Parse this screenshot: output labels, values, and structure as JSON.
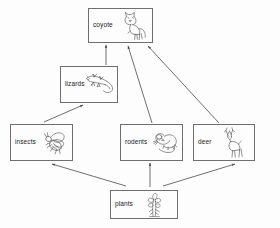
{
  "diagram": {
    "background_color": "#fdfdfd",
    "line_color": "#6e6e6e",
    "arrow_color": "#4a4a4a",
    "text_color": "#1a1a1a",
    "nodes": [
      {
        "id": "coyote",
        "label": "coyote",
        "icon": "coyote-illustration",
        "x": 88,
        "y": 8,
        "w": 65,
        "h": 35
      },
      {
        "id": "lizards",
        "label": "lizards",
        "icon": "lizard-illustration",
        "x": 60,
        "y": 66,
        "w": 58,
        "h": 37
      },
      {
        "id": "insects",
        "label": "insects",
        "icon": "insect-illustration",
        "x": 10,
        "y": 124,
        "w": 63,
        "h": 37
      },
      {
        "id": "rodents",
        "label": "rodents",
        "icon": "rodent-illustration",
        "x": 120,
        "y": 124,
        "w": 63,
        "h": 37
      },
      {
        "id": "deer",
        "label": "deer",
        "icon": "deer-illustration",
        "x": 193,
        "y": 124,
        "w": 62,
        "h": 37
      },
      {
        "id": "plants",
        "label": "plants",
        "icon": "plant-illustration",
        "x": 110,
        "y": 190,
        "w": 68,
        "h": 29
      }
    ],
    "edges": [
      {
        "id": "lizards-to-coyote",
        "from": "lizards",
        "to": "coyote",
        "x1": 106,
        "y1": 65,
        "x2": 106,
        "y2": 45
      },
      {
        "id": "rodents-to-coyote",
        "from": "rodents",
        "to": "coyote",
        "x1": 152,
        "y1": 123,
        "x2": 128,
        "y2": 46
      },
      {
        "id": "deer-to-coyote",
        "from": "deer",
        "to": "coyote",
        "x1": 219,
        "y1": 123,
        "x2": 148,
        "y2": 46
      },
      {
        "id": "insects-to-lizards",
        "from": "insects",
        "to": "lizards",
        "x1": 44,
        "y1": 122,
        "x2": 83,
        "y2": 105
      },
      {
        "id": "plants-to-insects",
        "from": "plants",
        "to": "insects",
        "x1": 126,
        "y1": 186,
        "x2": 52,
        "y2": 164
      },
      {
        "id": "plants-to-rodents",
        "from": "plants",
        "to": "rodents",
        "x1": 150,
        "y1": 187,
        "x2": 150,
        "y2": 163
      },
      {
        "id": "plants-to-deer",
        "from": "plants",
        "to": "deer",
        "x1": 163,
        "y1": 186,
        "x2": 235,
        "y2": 164
      }
    ]
  }
}
